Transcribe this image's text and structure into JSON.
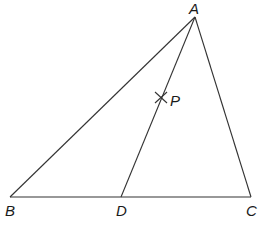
{
  "diagram": {
    "type": "geometry-triangle",
    "points": {
      "A": {
        "label": "A",
        "x": 195,
        "y": 17
      },
      "B": {
        "label": "B",
        "x": 10,
        "y": 197
      },
      "C": {
        "label": "C",
        "x": 251,
        "y": 197
      },
      "D": {
        "label": "D",
        "x": 121,
        "y": 197
      },
      "P": {
        "label": "P",
        "x": 161,
        "y": 97
      }
    },
    "segments": [
      "AB",
      "AC",
      "BC",
      "AD"
    ],
    "marks": [
      {
        "at": "P",
        "kind": "cross"
      }
    ],
    "colors": {
      "line": "#333333",
      "text": "#1a1a1a",
      "background": "#ffffff"
    }
  }
}
